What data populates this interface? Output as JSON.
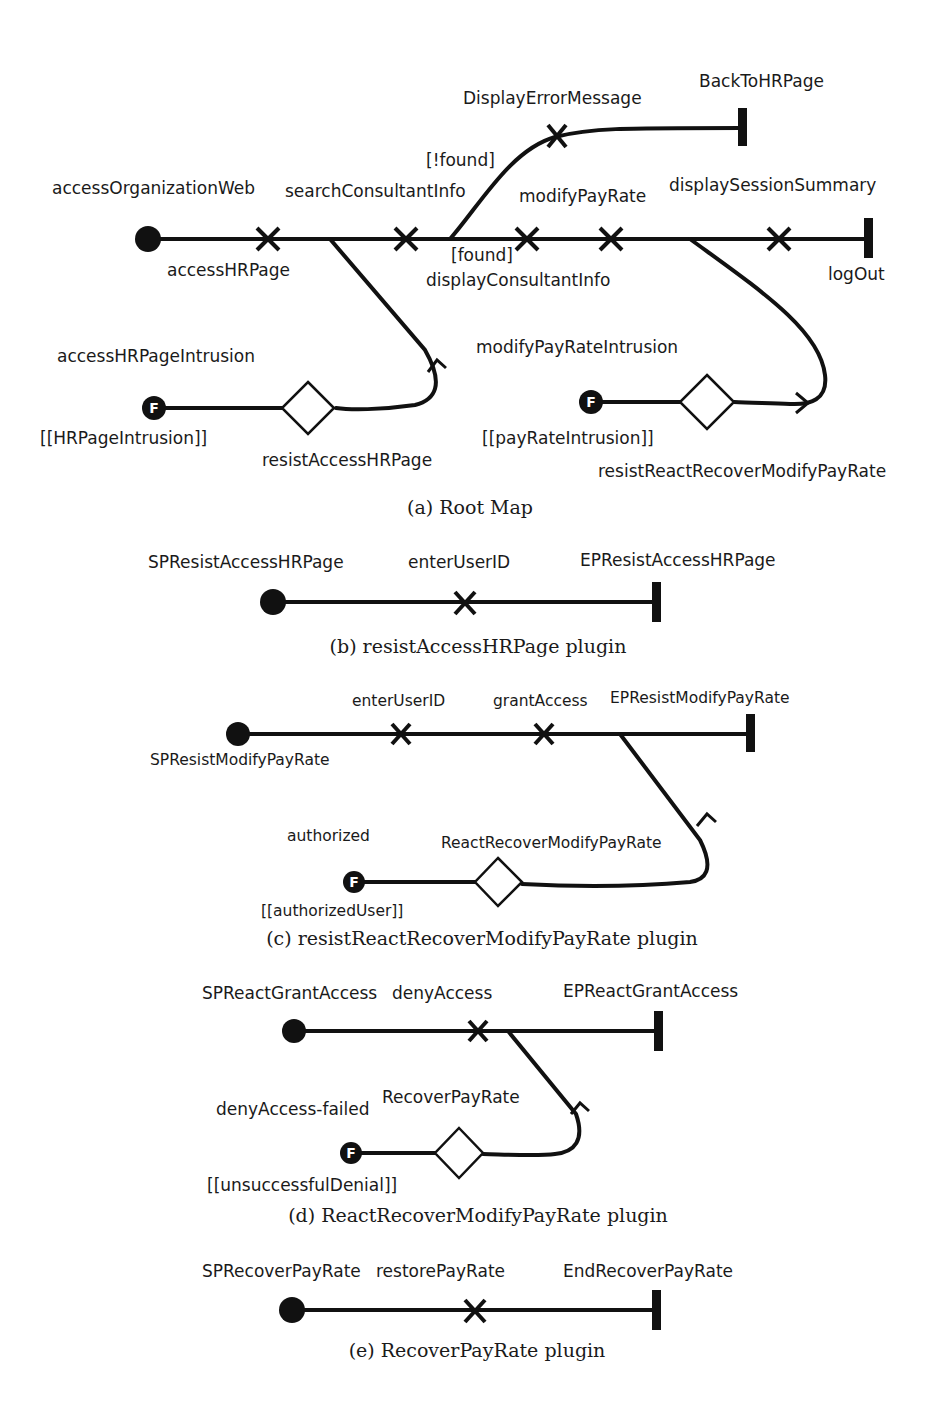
{
  "figure": {
    "a": {
      "caption": "(a) Root Map",
      "start_label": "accessOrganizationWeb",
      "responsibilities": {
        "accessHRPage": "accessHRPage",
        "searchConsultantInfo": "searchConsultantInfo",
        "modifyPayRate": "modifyPayRate",
        "displayConsultantInfo": "displayConsultantInfo",
        "displaySessionSummary": "displaySessionSummary",
        "displayErrorMessage": "DisplayErrorMessage"
      },
      "conditions": {
        "not_found": "[!found]",
        "found": "[found]"
      },
      "end_points": {
        "backToHRPage": "BackToHRPage",
        "logOut": "logOut"
      },
      "failure_points": [
        {
          "label": "accessHRPageIntrusion",
          "condition": "[[HRPageIntrusion]]",
          "stub": "resistAccessHRPage"
        },
        {
          "label": "modifyPayRateIntrusion",
          "condition": "[[payRateIntrusion]]",
          "stub": "resistReactRecoverModifyPayRate"
        }
      ]
    },
    "b": {
      "caption": "(b) resistAccessHRPage plugin",
      "start_label": "SPResistAccessHRPage",
      "responsibility": "enterUserID",
      "end_label": "EPResistAccessHRPage"
    },
    "c": {
      "caption": "(c) resistReactRecoverModifyPayRate plugin",
      "start_label": "SPResistModifyPayRate",
      "responsibilities": [
        "enterUserID",
        "grantAccess"
      ],
      "end_label": "EPResistModifyPayRate",
      "failure_point": {
        "label": "authorized",
        "condition": "[[authorizedUser]]",
        "stub": "ReactRecoverModifyPayRate"
      }
    },
    "d": {
      "caption": "(d) ReactRecoverModifyPayRate plugin",
      "start_label": "SPReactGrantAccess",
      "responsibility": "denyAccess",
      "end_label": "EPReactGrantAccess",
      "failure_point": {
        "label": "denyAccess-failed",
        "condition": "[[unsuccessfulDenial]]",
        "stub": "RecoverPayRate"
      }
    },
    "e": {
      "caption": "(e) RecoverPayRate plugin",
      "start_label": "SPRecoverPayRate",
      "responsibility": "restorePayRate",
      "end_label": "EndRecoverPayRate"
    }
  },
  "icons": {
    "start_point": "filled-circle",
    "responsibility": "x-mark",
    "end_point": "bar",
    "stub": "diamond",
    "failure_point": "F-circle",
    "failure_glyph": "F"
  },
  "colors": {
    "ink": "#111111",
    "background": "#ffffff"
  }
}
